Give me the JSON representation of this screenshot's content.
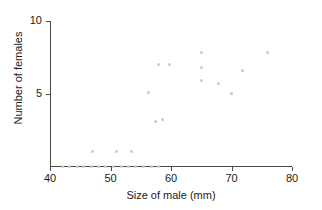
{
  "figure": {
    "background": "#ffffff",
    "point_color": "#c9c9c9",
    "axis_color": "#4a4a4a",
    "text_color": "#1a1a1a"
  },
  "axes": {
    "x_title": "Size of male (mm)",
    "y_title": "Number of females",
    "x_ticks": [
      "40",
      "50",
      "60",
      "70",
      "80"
    ],
    "y_ticks": [
      "5",
      "10"
    ]
  },
  "chart_data": {
    "type": "scatter",
    "title": "",
    "xlabel": "Size of male (mm)",
    "ylabel": "Number of females",
    "xlim": [
      40,
      80
    ],
    "ylim": [
      0,
      10
    ],
    "xticks": [
      40,
      50,
      60,
      70,
      80
    ],
    "yticks": [
      5,
      10
    ],
    "grid": false,
    "legend": null,
    "marker": "circle",
    "marker_color": "#c9c9c9",
    "marker_size": 3,
    "points": [
      {
        "x": 42.0,
        "y": 0
      },
      {
        "x": 43.2,
        "y": 0
      },
      {
        "x": 44.5,
        "y": 0
      },
      {
        "x": 45.5,
        "y": 0
      },
      {
        "x": 46.8,
        "y": 0
      },
      {
        "x": 48.0,
        "y": 0
      },
      {
        "x": 49.2,
        "y": 0
      },
      {
        "x": 50.5,
        "y": 0
      },
      {
        "x": 51.8,
        "y": 0
      },
      {
        "x": 53.0,
        "y": 0
      },
      {
        "x": 54.2,
        "y": 0
      },
      {
        "x": 55.5,
        "y": 0
      },
      {
        "x": 56.8,
        "y": 0
      },
      {
        "x": 58.0,
        "y": 0
      },
      {
        "x": 47.0,
        "y": 1.0
      },
      {
        "x": 51.0,
        "y": 1.0
      },
      {
        "x": 53.5,
        "y": 1.0
      },
      {
        "x": 57.5,
        "y": 3.1
      },
      {
        "x": 58.6,
        "y": 3.2
      },
      {
        "x": 56.2,
        "y": 5.1
      },
      {
        "x": 58.0,
        "y": 7.0
      },
      {
        "x": 59.8,
        "y": 7.0
      },
      {
        "x": 65.0,
        "y": 7.8
      },
      {
        "x": 65.0,
        "y": 6.8
      },
      {
        "x": 65.0,
        "y": 5.9
      },
      {
        "x": 67.8,
        "y": 5.7
      },
      {
        "x": 70.0,
        "y": 5.0
      },
      {
        "x": 71.8,
        "y": 6.6
      },
      {
        "x": 76.0,
        "y": 7.8
      }
    ]
  }
}
